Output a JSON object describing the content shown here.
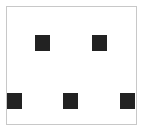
{
  "board": {
    "border_color": "#c8c8c8",
    "background": "#ffffff"
  },
  "squares": [
    {
      "x": 35,
      "y": 35,
      "color": "#222222"
    },
    {
      "x": 92,
      "y": 35,
      "color": "#222222"
    },
    {
      "x": 7,
      "y": 93,
      "color": "#222222"
    },
    {
      "x": 63,
      "y": 93,
      "color": "#222222"
    },
    {
      "x": 120,
      "y": 93,
      "color": "#222222"
    }
  ]
}
